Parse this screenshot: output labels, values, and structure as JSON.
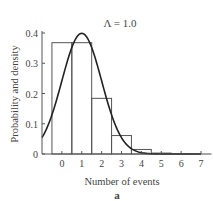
{
  "chart_data": {
    "type": "bar",
    "title": "Λ = 1.0",
    "xlabel": "Number of events",
    "ylabel": "Probability and density",
    "panel_label": "a",
    "categories": [
      "0",
      "1",
      "2",
      "3",
      "4",
      "5",
      "6",
      "7"
    ],
    "series": [
      {
        "name": "Poisson probability",
        "kind": "bar",
        "values": [
          0.368,
          0.368,
          0.184,
          0.061,
          0.015,
          0.003,
          0.0005,
          0.0001
        ]
      },
      {
        "name": "Normal density (mean 1, sd 1)",
        "kind": "line",
        "mean": 1.0,
        "sd": 1.0
      }
    ],
    "xlim": [
      -1,
      7
    ],
    "ylim": [
      0,
      0.4
    ],
    "yticks": [
      "0",
      "0.1",
      "0.2",
      "0.3",
      "0.4"
    ],
    "xticks": [
      "0",
      "1",
      "2",
      "3",
      "4",
      "5",
      "6",
      "7"
    ],
    "grid": false
  }
}
